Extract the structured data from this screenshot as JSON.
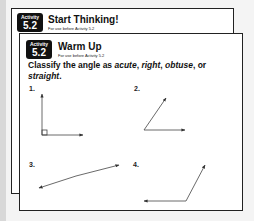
{
  "back_card": {
    "badge": {
      "label": "Activity",
      "number": "5.2"
    },
    "title": "Start Thinking!",
    "subtitle": "For use before Activity 5.2"
  },
  "front_card": {
    "badge": {
      "label": "Activity",
      "number": "5.2"
    },
    "title": "Warm Up",
    "subtitle": "For use before Activity 5.2",
    "prompt": {
      "before": "Classify the angle as ",
      "w1": "acute",
      "sep1": ", ",
      "w2": "right",
      "sep2": ", ",
      "w3": "obtuse",
      "sep3": ", or ",
      "w4": "straight",
      "end": "."
    },
    "problems": [
      {
        "number": "1.",
        "type_shown": "right angle figure"
      },
      {
        "number": "2.",
        "type_shown": "angle figure"
      },
      {
        "number": "3.",
        "type_shown": "angle figure"
      },
      {
        "number": "4.",
        "type_shown": "angle figure"
      }
    ]
  }
}
